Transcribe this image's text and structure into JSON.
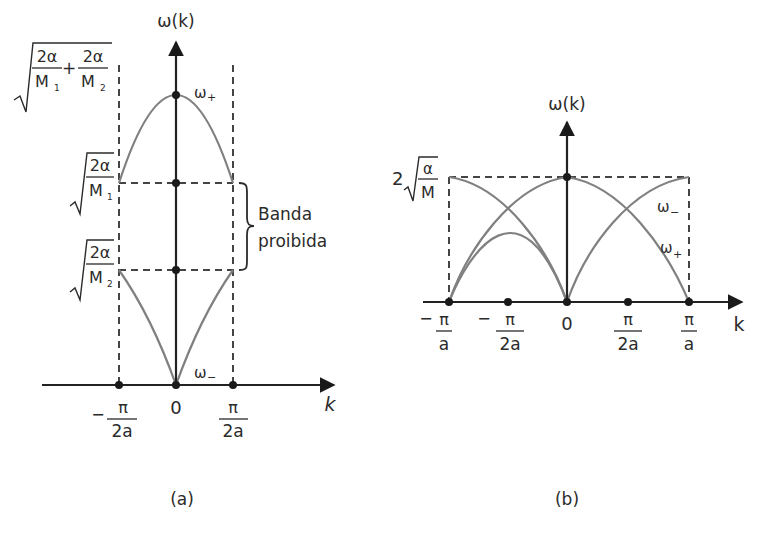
{
  "figure": {
    "panel_a": {
      "caption": "(a)",
      "y_axis_label": "ω(k)",
      "x_axis_label": "k",
      "origin_label": "0",
      "x_ticks": [
        {
          "sign": "−",
          "num": "π",
          "den": "2a"
        },
        {
          "sign": "",
          "num": "π",
          "den": "2a"
        }
      ],
      "y_levels": {
        "top": {
          "num1": "2α",
          "den1": "M",
          "sub1": "1",
          "op": "+",
          "num2": "2α",
          "den2": "M",
          "sub2": "2"
        },
        "upper_band": {
          "num": "2α",
          "den": "M",
          "sub": "1"
        },
        "lower_band": {
          "num": "2α",
          "den": "M",
          "sub": "2"
        }
      },
      "branch_labels": {
        "optical": {
          "base": "ω",
          "sub": "+"
        },
        "acoustic": {
          "base": "ω",
          "sub": "−"
        }
      },
      "gap_label_line1": "Banda",
      "gap_label_line2": "proibida"
    },
    "panel_b": {
      "caption": "(b)",
      "y_axis_label": "ω(k)",
      "x_axis_label": "k",
      "origin_label": "0",
      "x_ticks": [
        {
          "sign": "−",
          "num": "π",
          "den": "a"
        },
        {
          "sign": "−",
          "num": "π",
          "den": "2a"
        },
        {
          "sign": "",
          "num": "π",
          "den": "2a"
        },
        {
          "sign": "",
          "num": "π",
          "den": "a"
        }
      ],
      "y_level": {
        "coef": "2",
        "num": "α",
        "den": "M"
      },
      "branch_labels": {
        "acoustic": {
          "base": "ω",
          "sub": "−"
        },
        "optical": {
          "base": "ω",
          "sub": "+"
        }
      }
    }
  }
}
